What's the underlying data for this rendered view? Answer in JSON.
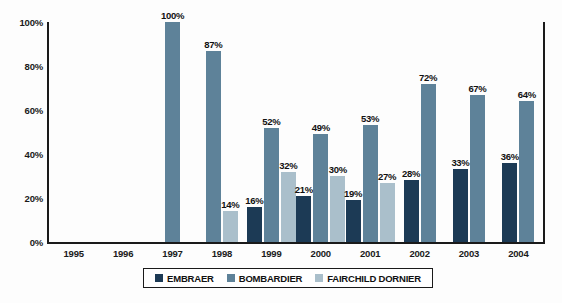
{
  "chart_data": {
    "type": "bar",
    "title": "",
    "xlabel": "",
    "ylabel": "",
    "ylim": [
      0,
      100
    ],
    "grid": false,
    "legend_position": "bottom",
    "categories": [
      "1995",
      "1996",
      "1997",
      "1998",
      "1999",
      "2000",
      "2001",
      "2002",
      "2003",
      "2004"
    ],
    "ytick_labels": [
      "0%",
      "20%",
      "40%",
      "60%",
      "80%",
      "100%"
    ],
    "ytick_values": [
      0,
      20,
      40,
      60,
      80,
      100
    ],
    "series": [
      {
        "name": "EMBRAER",
        "color": "#1c3a55",
        "values": [
          null,
          null,
          null,
          null,
          16,
          21,
          19,
          28,
          33,
          36
        ],
        "labels": [
          "",
          "",
          "",
          "",
          "16%",
          "21%",
          "19%",
          "28%",
          "33%",
          "36%"
        ]
      },
      {
        "name": "BOMBARDIER",
        "color": "#5e8299",
        "values": [
          null,
          null,
          100,
          87,
          52,
          49,
          53,
          72,
          67,
          64
        ],
        "labels": [
          "",
          "",
          "100%",
          "87%",
          "52%",
          "49%",
          "53%",
          "72%",
          "67%",
          "64%"
        ]
      },
      {
        "name": "FAIRCHILD DORNIER",
        "color": "#aabfcb",
        "values": [
          null,
          null,
          null,
          14,
          32,
          30,
          27,
          null,
          null,
          null
        ],
        "labels": [
          "",
          "",
          "",
          "14%",
          "32%",
          "30%",
          "27%",
          "",
          "",
          ""
        ]
      }
    ]
  },
  "legend": {
    "items": [
      {
        "label": "EMBRAER",
        "color": "#1c3a55"
      },
      {
        "label": "BOMBARDIER",
        "color": "#5e8299"
      },
      {
        "label": "FAIRCHILD DORNIER",
        "color": "#aabfcb"
      }
    ]
  }
}
